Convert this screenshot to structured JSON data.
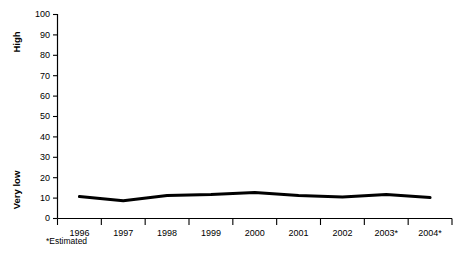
{
  "chart_data": {
    "type": "line",
    "title": "",
    "subtitle": "",
    "xlabel": "",
    "ylabel": "",
    "categories": [
      "1996",
      "1997",
      "1998",
      "1999",
      "2000",
      "2001",
      "2002",
      "2003*",
      "2004*"
    ],
    "values": [
      10.5,
      8.5,
      11,
      11.5,
      12.5,
      11,
      10.3,
      11.5,
      10
    ],
    "series": [
      {
        "name": "",
        "values": [
          10.5,
          8.5,
          11,
          11.5,
          12.5,
          11,
          10.3,
          11.5,
          10
        ]
      }
    ],
    "ylim": [
      0,
      100
    ],
    "yticks": [
      0,
      10,
      20,
      30,
      40,
      50,
      60,
      70,
      80,
      90,
      100
    ],
    "ytick_labels": [
      "0",
      "10",
      "20",
      "30",
      "40",
      "50",
      "60",
      "70",
      "80",
      "90",
      "100"
    ],
    "grid": false,
    "legend": false,
    "legend_position": "none",
    "line_color": "#000000",
    "line_width": 3,
    "markers": false,
    "axis_color": "#000000",
    "background_color": "#ffffff",
    "scale_annotations": [
      {
        "text": "High",
        "value": 90,
        "position": "y-axis-upper"
      },
      {
        "text": "Very low",
        "value": 13,
        "position": "y-axis-lower"
      }
    ],
    "annotations": [
      {
        "text": "*Estimated",
        "position": "below-axis-left"
      }
    ]
  },
  "axis": {
    "y_label_high": "High",
    "y_label_very_low": "Very low"
  },
  "footnote": {
    "text": "*Estimated"
  }
}
